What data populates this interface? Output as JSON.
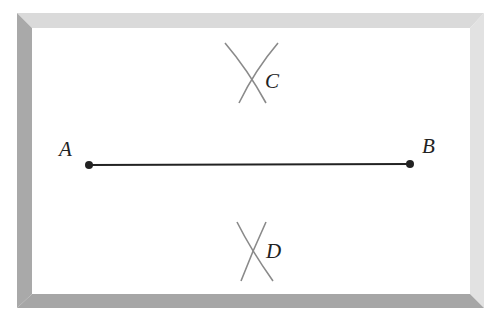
{
  "diagram": {
    "title": "",
    "frame": {
      "outer": {
        "x": 17,
        "y": 13,
        "w": 467,
        "h": 295
      },
      "inner": {
        "x": 32,
        "y": 28,
        "w": 438,
        "h": 266
      },
      "colors": {
        "top": "#dadada",
        "left": "#a9a9a9",
        "right": "#e2e2e2",
        "bottom": "#a6a6a6",
        "fill": "#ffffff"
      }
    },
    "segment": {
      "from": {
        "label": "A",
        "x": 89,
        "y": 165
      },
      "to": {
        "label": "B",
        "x": 410,
        "y": 164
      },
      "color": "#222222"
    },
    "points": [
      {
        "label": "A",
        "label_x": 59,
        "label_y": 156
      },
      {
        "label": "B",
        "label_x": 422,
        "label_y": 153
      }
    ],
    "arc_crossings": [
      {
        "label": "C",
        "cross_x": 251,
        "cross_y": 73,
        "label_x": 265,
        "label_y": 88
      },
      {
        "label": "D",
        "cross_x": 252,
        "cross_y": 251,
        "label_x": 267,
        "label_y": 258
      }
    ],
    "arc_color": "#8a8a8a"
  }
}
